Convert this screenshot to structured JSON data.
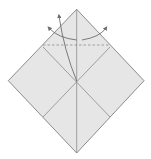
{
  "diagram": {
    "type": "origami-fold-diagram",
    "colors": {
      "paper_fill": "#e6e6e6",
      "edge_stroke": "#8c8c8c",
      "crease_stroke": "#8c8c8c",
      "dashed_stroke": "#8c8c8c",
      "arrow_stroke": "#6e6e6e",
      "background": "#ffffff"
    },
    "square": {
      "top": [
        76.7,
        9.3
      ],
      "right": [
        144.0,
        80.7
      ],
      "bottom": [
        76.7,
        153.0
      ],
      "left": [
        8.3,
        80.7
      ],
      "center": [
        76.7,
        81.0
      ]
    },
    "creases": [
      {
        "name": "vertical-crease",
        "from": [
          76.7,
          9.3
        ],
        "to": [
          76.7,
          153.0
        ]
      },
      {
        "name": "diagonal-crease-left",
        "from": [
          43.0,
          47.0
        ],
        "to": [
          110.0,
          117.0
        ]
      },
      {
        "name": "diagonal-crease-right",
        "from": [
          110.0,
          47.0
        ],
        "to": [
          43.0,
          117.0
        ]
      }
    ],
    "valley_fold_line": {
      "from": [
        43.0,
        45.0
      ],
      "to": [
        110.0,
        45.0
      ]
    },
    "arrows": [
      {
        "name": "arrow-center-up",
        "path": "M76.7 81 Q64 50 59 16"
      },
      {
        "name": "arrow-left-curve",
        "path": "M76.7 40 Q58 38 49 28"
      },
      {
        "name": "arrow-right-curve",
        "path": "M82 40 Q100 37 106 28"
      }
    ]
  }
}
